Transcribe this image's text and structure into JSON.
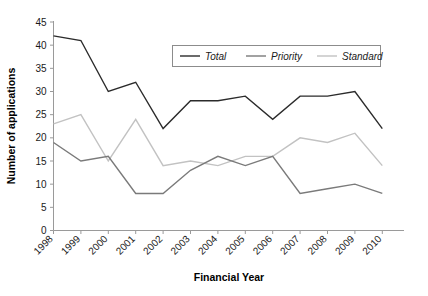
{
  "chart_data": {
    "type": "line",
    "title": "",
    "xlabel": "Financial Year",
    "ylabel": "Number of applications",
    "categories": [
      "1998",
      "1999",
      "2000",
      "2001",
      "2002",
      "2003",
      "2004",
      "2005",
      "2006",
      "2007",
      "2008",
      "2009",
      "2010"
    ],
    "ylim": [
      0,
      45
    ],
    "ytick_labels": [
      "0",
      "5",
      "10",
      "15",
      "20",
      "25",
      "30",
      "35",
      "40",
      "45"
    ],
    "ytick_values": [
      0,
      5,
      10,
      15,
      20,
      25,
      30,
      35,
      40,
      45
    ],
    "grid": false,
    "legend_position": "top-right",
    "series": [
      {
        "name": "Total",
        "color": "#2b2b2b",
        "values": [
          42,
          41,
          30,
          32,
          22,
          28,
          28,
          29,
          24,
          29,
          29,
          30,
          22
        ]
      },
      {
        "name": "Priority",
        "color": "#7a7a7a",
        "values": [
          19,
          15,
          16,
          8,
          8,
          13,
          16,
          14,
          16,
          8,
          9,
          10,
          8
        ]
      },
      {
        "name": "Standard",
        "color": "#c2c2c2",
        "values": [
          23,
          25,
          15,
          24,
          14,
          15,
          14,
          16,
          16,
          20,
          19,
          21,
          14
        ]
      }
    ]
  },
  "legend": {
    "items": [
      {
        "label": "Total"
      },
      {
        "label": "Priority"
      },
      {
        "label": "Standard"
      }
    ]
  },
  "axes": {
    "x_title": "Financial Year",
    "y_title": "Number of applications"
  }
}
